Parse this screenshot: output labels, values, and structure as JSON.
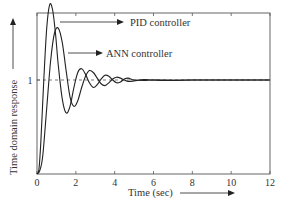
{
  "chart_data": {
    "type": "line",
    "title": "",
    "xlabel": "Time (sec)",
    "ylabel": "Time domain response",
    "xlim": [
      0,
      12
    ],
    "ylim": [
      0,
      1.85
    ],
    "xticks": [
      0,
      2,
      4,
      6,
      8,
      10,
      12
    ],
    "yticks": [
      1
    ],
    "reference_line": {
      "y": 1,
      "style": "dashed"
    },
    "grid": false,
    "legend": "none (inline arrow annotations)",
    "annotations": [
      {
        "text": "PID controller",
        "points_to": "PID controller peak"
      },
      {
        "text": "ANN controller",
        "points_to": "ANN controller peak"
      }
    ],
    "series": [
      {
        "name": "PID controller",
        "x": [
          0,
          0.1,
          0.2,
          0.35,
          0.5,
          0.65,
          0.8,
          0.95,
          1.1,
          1.3,
          1.5,
          1.7,
          1.9,
          2.1,
          2.3,
          2.5,
          2.7,
          2.9,
          3.1,
          3.3,
          3.5,
          3.7,
          3.9,
          4.1,
          4.3,
          4.5,
          4.7,
          5.0,
          5.5,
          6,
          7,
          8,
          9,
          10,
          11,
          12
        ],
        "y": [
          0,
          0.05,
          0.35,
          1.0,
          1.55,
          1.8,
          1.75,
          1.5,
          1.15,
          0.8,
          0.65,
          0.72,
          0.92,
          1.08,
          1.12,
          1.06,
          0.97,
          0.92,
          0.95,
          1.01,
          1.05,
          1.04,
          1.0,
          0.97,
          0.98,
          1.01,
          1.02,
          1.0,
          0.995,
          1.0,
          1.0,
          1.0,
          1.0,
          1.0,
          1.0,
          1.0
        ]
      },
      {
        "name": "ANN controller",
        "x": [
          0,
          0.15,
          0.3,
          0.5,
          0.7,
          0.9,
          1.1,
          1.3,
          1.5,
          1.7,
          1.9,
          2.1,
          2.3,
          2.5,
          2.7,
          2.9,
          3.1,
          3.3,
          3.5,
          3.7,
          3.9,
          4.1,
          4.3,
          4.5,
          4.7,
          5.0,
          5.5,
          6,
          7,
          8,
          9,
          10,
          11,
          12
        ],
        "y": [
          0,
          0.04,
          0.2,
          0.7,
          1.2,
          1.5,
          1.55,
          1.4,
          1.1,
          0.82,
          0.72,
          0.78,
          0.92,
          1.04,
          1.1,
          1.08,
          1.02,
          0.96,
          0.94,
          0.97,
          1.01,
          1.03,
          1.02,
          1.0,
          0.985,
          0.99,
          1.005,
          1.0,
          0.995,
          1.0,
          1.0,
          1.0,
          1.0,
          1.0
        ]
      }
    ]
  },
  "labels": {
    "pid": "PID controller",
    "ann": "ANN controller",
    "xlabel": "Time (sec)",
    "ylabel": "Time domain response",
    "ytick_1": "1",
    "xticks": [
      "0",
      "2",
      "4",
      "6",
      "8",
      "10",
      "12"
    ]
  }
}
